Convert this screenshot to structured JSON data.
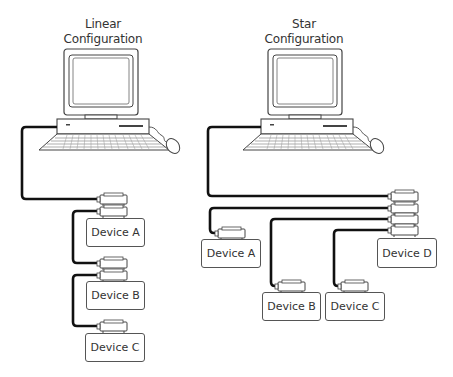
{
  "linear": {
    "title_line1": "Linear",
    "title_line2": "Configuration",
    "devices": [
      "Device A",
      "Device B",
      "Device C"
    ]
  },
  "star": {
    "title_line1": "Star",
    "title_line2": "Configuration",
    "devices": [
      "Device A",
      "Device B",
      "Device C",
      "Device D"
    ]
  },
  "colors": {
    "cable": "#111111",
    "outline": "#555555",
    "background": "#ffffff"
  }
}
